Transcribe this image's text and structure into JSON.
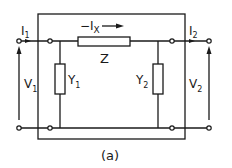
{
  "diagram": {
    "type": "two-port network (pi equivalent)",
    "caption": "(a)",
    "labels": {
      "i1": "I",
      "i1_sub": "1",
      "i2": "I",
      "i2_sub": "2",
      "ix": "−I",
      "ix_sub": "X",
      "z": "Z",
      "y1": "Y",
      "y1_sub": "1",
      "y2": "Y",
      "y2_sub": "2",
      "v1": "V",
      "v1_sub": "1",
      "v2": "V",
      "v2_sub": "2"
    },
    "components": [
      {
        "id": "Z",
        "kind": "series impedance",
        "position": "top branch"
      },
      {
        "id": "Y1",
        "kind": "shunt admittance",
        "position": "left"
      },
      {
        "id": "Y2",
        "kind": "shunt admittance",
        "position": "right"
      }
    ],
    "colors": {
      "ink": "#1a1a1a",
      "background": "#ffffff"
    }
  }
}
